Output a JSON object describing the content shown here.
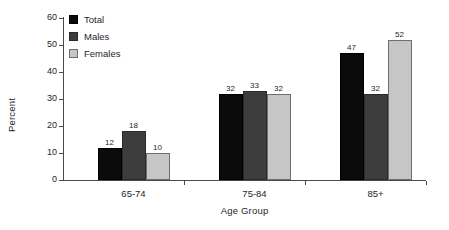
{
  "chart_data": {
    "type": "bar",
    "title": "",
    "subtitle": "",
    "xlabel": "Age Group",
    "ylabel": "Percent",
    "categories": [
      "65-74",
      "75-84",
      "85+"
    ],
    "series": [
      {
        "name": "Total",
        "color": "#0b0b0b",
        "values": [
          12,
          32,
          47
        ]
      },
      {
        "name": "Males",
        "color": "#3d3d3d",
        "values": [
          18,
          33,
          32
        ]
      },
      {
        "name": "Females",
        "color": "#c6c6c6",
        "values": [
          10,
          32,
          52
        ]
      }
    ],
    "ylim": [
      0,
      60
    ],
    "yticks": [
      0,
      10,
      20,
      30,
      40,
      50,
      60
    ],
    "ytick_labels": [
      "0",
      "10",
      "20",
      "30",
      "40",
      "50",
      "60"
    ],
    "grid": false,
    "legend_position": "top-left",
    "data_labels": true,
    "value_labels": [
      [
        "12",
        "18",
        "10"
      ],
      [
        "32",
        "33",
        "32"
      ],
      [
        "47",
        "32",
        "52"
      ]
    ]
  },
  "legend": {
    "items": [
      {
        "label": "Total"
      },
      {
        "label": "Males"
      },
      {
        "label": "Females"
      }
    ]
  }
}
